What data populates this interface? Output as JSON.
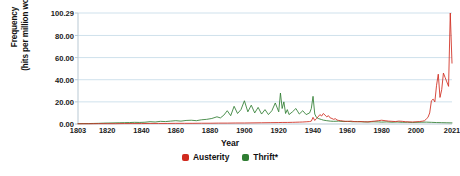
{
  "chart_data": {
    "type": "line",
    "title": "",
    "xlabel": "Year",
    "ylabel": "Frequency\n(hits per million words)",
    "xlim": [
      1803,
      2021
    ],
    "ylim": [
      0,
      100.29
    ],
    "grid": true,
    "legend_position": "bottom",
    "ytick_labels": [
      "0.00",
      "20.00",
      "40.00",
      "60.00",
      "80.00",
      "100.29"
    ],
    "ytick_values": [
      0,
      20,
      40,
      60,
      80,
      100.29
    ],
    "xtick_labels": [
      "1803",
      "1820",
      "1840",
      "1860",
      "1880",
      "1900",
      "1920",
      "1940",
      "1960",
      "1980",
      "2000",
      "2021"
    ],
    "xtick_values": [
      1803,
      1820,
      1840,
      1860,
      1880,
      1900,
      1920,
      1940,
      1960,
      1980,
      2000,
      2021
    ],
    "colors": {
      "austerity": "#d02a1e",
      "thrift": "#2f7d32",
      "grid": "#cfe1ec",
      "axis": "#b9c9d4",
      "background": "#ffffff",
      "text": "#111111"
    },
    "series": [
      {
        "name": "Austerity",
        "color": "#d02a1e",
        "x": [
          1803,
          1810,
          1815,
          1820,
          1825,
          1830,
          1835,
          1840,
          1845,
          1850,
          1855,
          1860,
          1865,
          1870,
          1875,
          1880,
          1885,
          1890,
          1895,
          1900,
          1905,
          1910,
          1915,
          1920,
          1922,
          1925,
          1928,
          1930,
          1932,
          1934,
          1936,
          1938,
          1939,
          1940,
          1941,
          1942,
          1943,
          1944,
          1945,
          1946,
          1947,
          1948,
          1949,
          1950,
          1951,
          1952,
          1953,
          1954,
          1955,
          1956,
          1957,
          1958,
          1959,
          1960,
          1962,
          1964,
          1966,
          1968,
          1970,
          1972,
          1974,
          1976,
          1978,
          1980,
          1982,
          1984,
          1986,
          1988,
          1990,
          1992,
          1994,
          1996,
          1998,
          2000,
          2002,
          2004,
          2005,
          2006,
          2007,
          2008,
          2009,
          2010,
          2011,
          2012,
          2013,
          2014,
          2015,
          2016,
          2017,
          2018,
          2019,
          2020,
          2021
        ],
        "values": [
          0.2,
          0.2,
          0.3,
          0.3,
          0.3,
          0.4,
          0.4,
          0.4,
          0.5,
          0.5,
          0.5,
          0.6,
          0.6,
          0.6,
          0.7,
          0.7,
          0.8,
          0.8,
          0.9,
          0.9,
          1.0,
          1.1,
          1.2,
          1.3,
          1.4,
          1.4,
          1.5,
          1.6,
          1.7,
          1.8,
          2.0,
          2.2,
          2.6,
          6.0,
          3.2,
          5.0,
          6.5,
          8.5,
          7.2,
          9.5,
          8.0,
          6.5,
          7.5,
          5.5,
          5.0,
          4.2,
          4.8,
          3.6,
          3.2,
          3.0,
          2.8,
          2.6,
          2.4,
          2.3,
          2.6,
          2.2,
          2.0,
          2.2,
          2.0,
          1.9,
          2.3,
          2.6,
          3.0,
          3.4,
          3.0,
          2.6,
          2.4,
          2.2,
          2.6,
          2.4,
          2.0,
          1.9,
          1.8,
          2.0,
          2.2,
          2.6,
          3.0,
          4.5,
          6.0,
          10.0,
          21.0,
          22.5,
          20.0,
          35.0,
          45.0,
          24.0,
          31.0,
          46.0,
          42.0,
          38.0,
          34.0,
          100.29,
          55.0
        ]
      },
      {
        "name": "Thrift*",
        "color": "#2f7d32",
        "x": [
          1803,
          1806,
          1809,
          1812,
          1815,
          1818,
          1821,
          1824,
          1827,
          1830,
          1833,
          1836,
          1839,
          1842,
          1845,
          1848,
          1851,
          1854,
          1857,
          1860,
          1863,
          1866,
          1869,
          1872,
          1875,
          1878,
          1881,
          1884,
          1886,
          1888,
          1890,
          1892,
          1894,
          1896,
          1898,
          1900,
          1902,
          1904,
          1906,
          1908,
          1910,
          1912,
          1914,
          1916,
          1918,
          1920,
          1921,
          1922,
          1923,
          1924,
          1925,
          1926,
          1928,
          1930,
          1932,
          1934,
          1936,
          1938,
          1939,
          1940,
          1941,
          1942,
          1943,
          1944,
          1945,
          1946,
          1948,
          1950,
          1952,
          1955,
          1958,
          1960,
          1963,
          1966,
          1969,
          1972,
          1975,
          1978,
          1980,
          1983,
          1986,
          1989,
          1992,
          1995,
          1998,
          2000,
          2003,
          2006,
          2009,
          2012,
          2015,
          2018,
          2021
        ],
        "values": [
          0.3,
          0.4,
          0.4,
          0.5,
          0.6,
          0.8,
          0.9,
          1.0,
          1.1,
          1.2,
          1.3,
          1.5,
          1.4,
          1.6,
          2.1,
          1.8,
          2.4,
          2.2,
          2.6,
          3.0,
          2.6,
          3.2,
          3.4,
          3.0,
          3.8,
          4.2,
          5.0,
          6.5,
          5.5,
          8.0,
          12.0,
          7.5,
          16.0,
          9.5,
          13.0,
          21.0,
          11.0,
          17.0,
          10.0,
          15.0,
          9.0,
          13.0,
          8.5,
          12.0,
          19.0,
          11.0,
          28.0,
          14.0,
          20.0,
          9.5,
          13.0,
          8.5,
          11.0,
          14.0,
          9.0,
          12.0,
          8.5,
          10.0,
          14.0,
          25.0,
          9.0,
          6.0,
          5.0,
          4.5,
          4.0,
          3.5,
          3.0,
          2.6,
          2.4,
          2.6,
          2.2,
          2.4,
          2.0,
          2.2,
          1.9,
          1.8,
          2.0,
          1.9,
          1.7,
          1.9,
          1.6,
          1.8,
          1.5,
          1.6,
          1.4,
          1.5,
          1.6,
          1.7,
          1.5,
          1.3,
          1.2,
          1.1,
          1.0
        ]
      }
    ]
  },
  "legend": {
    "items": [
      {
        "label": "Austerity",
        "color": "#d02a1e"
      },
      {
        "label": "Thrift*",
        "color": "#2f7d32"
      }
    ]
  }
}
